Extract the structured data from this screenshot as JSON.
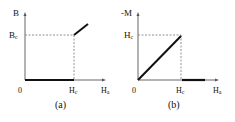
{
  "panels": [
    {
      "id": "a",
      "caption": "(a)",
      "y_axis_label": "B",
      "x_axis_label": "Ha",
      "x_axis_label_main": "H",
      "x_axis_label_sub": "a",
      "origin_label": "0",
      "x_tick_label_main": "H",
      "x_tick_label_sub": "c",
      "y_tick_label_main": "B",
      "y_tick_label_sub": "c"
    },
    {
      "id": "b",
      "caption": "(b)",
      "y_axis_label": "-M",
      "x_axis_label": "Ha",
      "x_axis_label_main": "H",
      "x_axis_label_sub": "a",
      "origin_label": "0",
      "x_tick_label_main": "H",
      "x_tick_label_sub": "c",
      "y_tick_label_main": "H",
      "y_tick_label_sub": "c"
    }
  ],
  "colors": {
    "axis": "#555555",
    "curve": "#111111",
    "dashed": "#777777"
  }
}
